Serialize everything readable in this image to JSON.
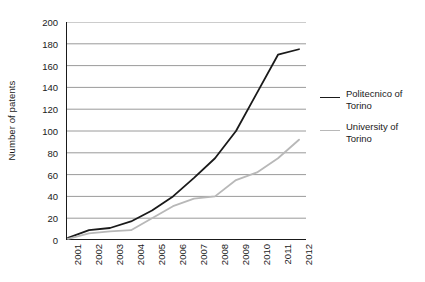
{
  "chart_data": {
    "type": "line",
    "title": "",
    "xlabel": "",
    "ylabel": "Number of patents",
    "x": [
      "2001",
      "2002",
      "2003",
      "2004",
      "2005",
      "2006",
      "2007",
      "2008",
      "2009",
      "2010",
      "2011",
      "2012"
    ],
    "xtick_labels": [
      "2001",
      "2002",
      "2003",
      "2004",
      "2005",
      "2006",
      "2007",
      "2008",
      "2009",
      "2010",
      "2011",
      "2012"
    ],
    "ytick_labels": [
      "0",
      "20",
      "40",
      "60",
      "80",
      "100",
      "120",
      "140",
      "160",
      "180",
      "200"
    ],
    "ytick_values": [
      0,
      20,
      40,
      60,
      80,
      100,
      120,
      140,
      160,
      180,
      200
    ],
    "ylim": [
      0,
      200
    ],
    "grid": "horizontal",
    "legend_position": "right",
    "series": [
      {
        "name": "Politecnico of Torino",
        "name_line1": "Politecnico of",
        "name_line2": "Torino",
        "color": "#1a1a1a",
        "width": 1.8,
        "values": [
          2,
          9,
          11,
          17,
          27,
          40,
          57,
          75,
          100,
          135,
          170,
          175
        ]
      },
      {
        "name": "University of Torino",
        "name_line1": "University of",
        "name_line2": "Torino",
        "color": "#b8b8b8",
        "width": 1.8,
        "values": [
          1,
          6,
          8,
          9,
          20,
          31,
          38,
          40,
          55,
          62,
          75,
          92
        ]
      }
    ]
  },
  "style": {
    "grid_color": "#808080",
    "axis_color": "#1a1a1a",
    "background": "#ffffff"
  }
}
